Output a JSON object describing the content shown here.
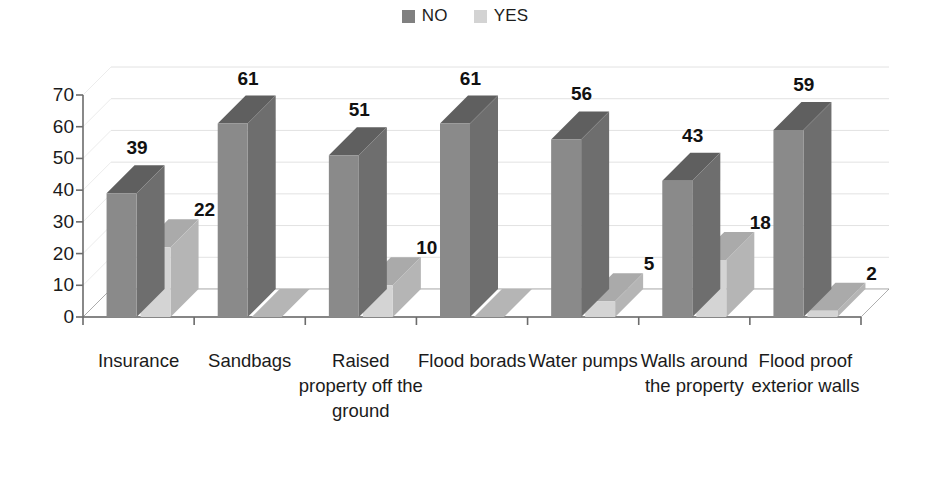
{
  "legend": {
    "position": "top-center",
    "items": [
      {
        "label": "NO",
        "color": "#808080",
        "icon": "legend-square-icon"
      },
      {
        "label": "YES",
        "color": "#d3d3d3",
        "icon": "legend-square-icon"
      }
    ]
  },
  "axis": {
    "y_ticks": [
      "70",
      "60",
      "50",
      "40",
      "30",
      "20",
      "10",
      "0"
    ]
  },
  "colors": {
    "no_front": "#8a8a8a",
    "no_side": "#6e6e6e",
    "no_top": "#5f5f5f",
    "yes_front": "#d4d4d4",
    "yes_side": "#b5b5b5",
    "yes_top": "#aaaaaa",
    "floor": "#ffffff",
    "axis_line": "#6b6b6b",
    "gridline": "#e2e2e2",
    "text": "#1b1b1b"
  },
  "chart_data": {
    "type": "bar",
    "title": "",
    "xlabel": "",
    "ylabel": "",
    "ylim": [
      0,
      70
    ],
    "ytick_step": 10,
    "grid": true,
    "legend_position": "top-center",
    "three_d": true,
    "categories": [
      "Insurance",
      "Sandbags",
      "Raised property off the ground",
      "Flood borads",
      "Water pumps",
      "Walls around the property",
      "Flood proof exterior walls"
    ],
    "series": [
      {
        "name": "NO",
        "values": [
          39,
          61,
          51,
          61,
          56,
          43,
          59
        ]
      },
      {
        "name": "YES",
        "values": [
          22,
          0,
          10,
          0,
          5,
          18,
          2
        ]
      }
    ],
    "data_labels": {
      "NO": [
        "39",
        "61",
        "51",
        "61",
        "56",
        "43",
        "59"
      ],
      "YES": [
        "22",
        "",
        "10",
        "",
        "5",
        "18",
        "2"
      ]
    }
  }
}
